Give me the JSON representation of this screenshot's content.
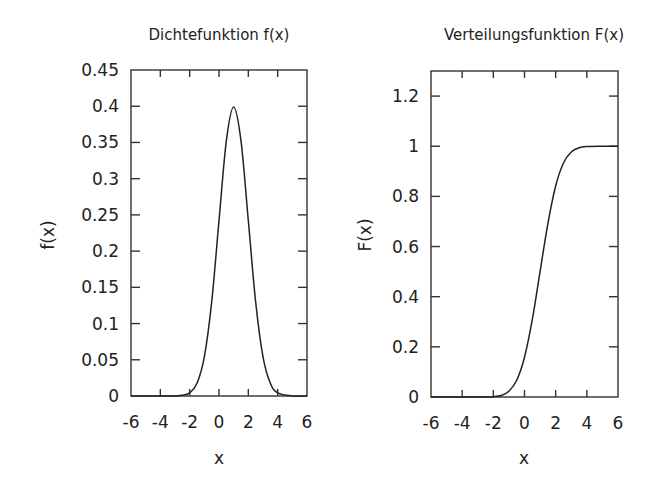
{
  "chart_data": [
    {
      "type": "line",
      "title": "Dichtefunktion f(x)",
      "xlabel": "x",
      "ylabel": "f(x)",
      "xlim": [
        -6,
        6
      ],
      "ylim": [
        0,
        0.45
      ],
      "xticks": [
        "-6",
        "-4",
        "-2",
        "0",
        "2",
        "4",
        "6"
      ],
      "yticks": [
        "0",
        "0.05",
        "0.1",
        "0.15",
        "0.2",
        "0.25",
        "0.3",
        "0.35",
        "0.4",
        "0.45"
      ],
      "grid": false,
      "series": [
        {
          "name": "f(x)",
          "x": [
            -6,
            -5,
            -4,
            -3,
            -2.5,
            -2,
            -1.5,
            -1,
            -0.5,
            0,
            0.5,
            1,
            1.5,
            2,
            2.5,
            3,
            3.5,
            4,
            5,
            6
          ],
          "y": [
            0,
            0,
            0,
            0.0001,
            0.0009,
            0.0044,
            0.0175,
            0.054,
            0.1295,
            0.242,
            0.3521,
            0.3989,
            0.3521,
            0.242,
            0.1295,
            0.054,
            0.0175,
            0.0044,
            0.0001,
            0
          ]
        }
      ]
    },
    {
      "type": "line",
      "title": "Verteilungsfunktion F(x)",
      "xlabel": "x",
      "ylabel": "F(x)",
      "xlim": [
        -6,
        6
      ],
      "ylim": [
        0,
        1.3
      ],
      "xticks": [
        "-6",
        "-4",
        "-2",
        "0",
        "2",
        "4",
        "6"
      ],
      "yticks": [
        "0",
        "0.2",
        "0.4",
        "0.6",
        "0.8",
        "1",
        "1.2"
      ],
      "grid": false,
      "series": [
        {
          "name": "F(x)",
          "x": [
            -6,
            -5,
            -4,
            -3,
            -2.5,
            -2,
            -1.5,
            -1,
            -0.5,
            0,
            0.5,
            1,
            1.5,
            2,
            2.5,
            3,
            3.5,
            4,
            5,
            6
          ],
          "y": [
            0,
            0,
            0,
            0,
            0.0002,
            0.0013,
            0.0062,
            0.0228,
            0.0668,
            0.1587,
            0.3085,
            0.5,
            0.6915,
            0.8413,
            0.9332,
            0.9772,
            0.9938,
            0.9987,
            1,
            1
          ]
        }
      ]
    }
  ]
}
